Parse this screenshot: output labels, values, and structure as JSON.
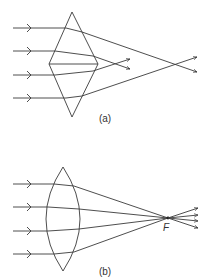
{
  "figure": {
    "diagram_a": {
      "label": "(a)",
      "lens_shape": "rhombus (two prisms base-to-base)",
      "incoming_rays": 4,
      "description": "Parallel rays refracted by a rhombus-shaped lens converge at different points"
    },
    "diagram_b": {
      "label": "(b)",
      "lens_shape": "biconvex lens",
      "incoming_rays": 4,
      "focal_point_label": "F",
      "description": "Parallel rays refracted by a convex lens converge at a single focal point F"
    },
    "colors": {
      "line": "#3a3a3a",
      "background": "#ffffff"
    }
  }
}
